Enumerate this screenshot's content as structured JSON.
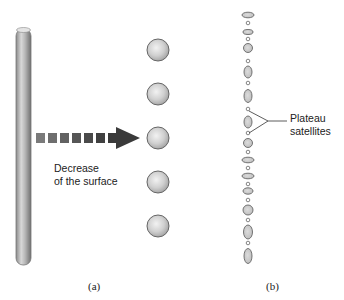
{
  "panel_a": {
    "caption": "(a)",
    "arrow_label_line1": "Decrease",
    "arrow_label_line2": "of the surface",
    "column": {
      "x": 16,
      "y": 27,
      "width": 15,
      "height": 241
    },
    "spheres": [
      {
        "cx": 158,
        "cy": 50,
        "r": 11
      },
      {
        "cx": 158,
        "cy": 94,
        "r": 11
      },
      {
        "cx": 158,
        "cy": 138,
        "r": 11
      },
      {
        "cx": 158,
        "cy": 182,
        "r": 11
      },
      {
        "cx": 158,
        "cy": 226,
        "r": 11
      }
    ],
    "arrow_squares": [
      36,
      48,
      60,
      72,
      84,
      96
    ],
    "arrow_color": "#3a3a3a"
  },
  "panel_b": {
    "caption": "(b)",
    "annotation_line1": "Plateau",
    "annotation_line2": "satellites",
    "drops": [
      {
        "cy": 15,
        "rx": 6,
        "ry": 2.8
      },
      {
        "cy": 23,
        "rx": 1.8,
        "ry": 1.8
      },
      {
        "cy": 32,
        "rx": 5,
        "ry": 2.5
      },
      {
        "cy": 39,
        "rx": 1.8,
        "ry": 1.8
      },
      {
        "cy": 48,
        "rx": 4.5,
        "ry": 4.5
      },
      {
        "cy": 61,
        "rx": 1.8,
        "ry": 1.8
      },
      {
        "cy": 72,
        "rx": 4,
        "ry": 6
      },
      {
        "cy": 83,
        "rx": 1.8,
        "ry": 1.8
      },
      {
        "cy": 96,
        "rx": 4,
        "ry": 6.5
      },
      {
        "cy": 109,
        "rx": 1.8,
        "ry": 1.8
      },
      {
        "cy": 122,
        "rx": 4,
        "ry": 6
      },
      {
        "cy": 133,
        "rx": 1.8,
        "ry": 1.8
      },
      {
        "cy": 143,
        "rx": 4.5,
        "ry": 4.5
      },
      {
        "cy": 152,
        "rx": 1.8,
        "ry": 1.8
      },
      {
        "cy": 160,
        "rx": 6,
        "ry": 2.8
      },
      {
        "cy": 168,
        "rx": 1.8,
        "ry": 1.8
      },
      {
        "cy": 176,
        "rx": 6,
        "ry": 2.8
      },
      {
        "cy": 184,
        "rx": 1.8,
        "ry": 1.8
      },
      {
        "cy": 191,
        "rx": 5,
        "ry": 3.2
      },
      {
        "cy": 200,
        "rx": 1.8,
        "ry": 1.8
      },
      {
        "cy": 210,
        "rx": 5,
        "ry": 5
      },
      {
        "cy": 220,
        "rx": 1.8,
        "ry": 1.8
      },
      {
        "cy": 232,
        "rx": 4.5,
        "ry": 7
      },
      {
        "cy": 243,
        "rx": 1.8,
        "ry": 1.8
      },
      {
        "cy": 256,
        "rx": 4,
        "ry": 7.5
      }
    ],
    "drop_cx": 248
  }
}
